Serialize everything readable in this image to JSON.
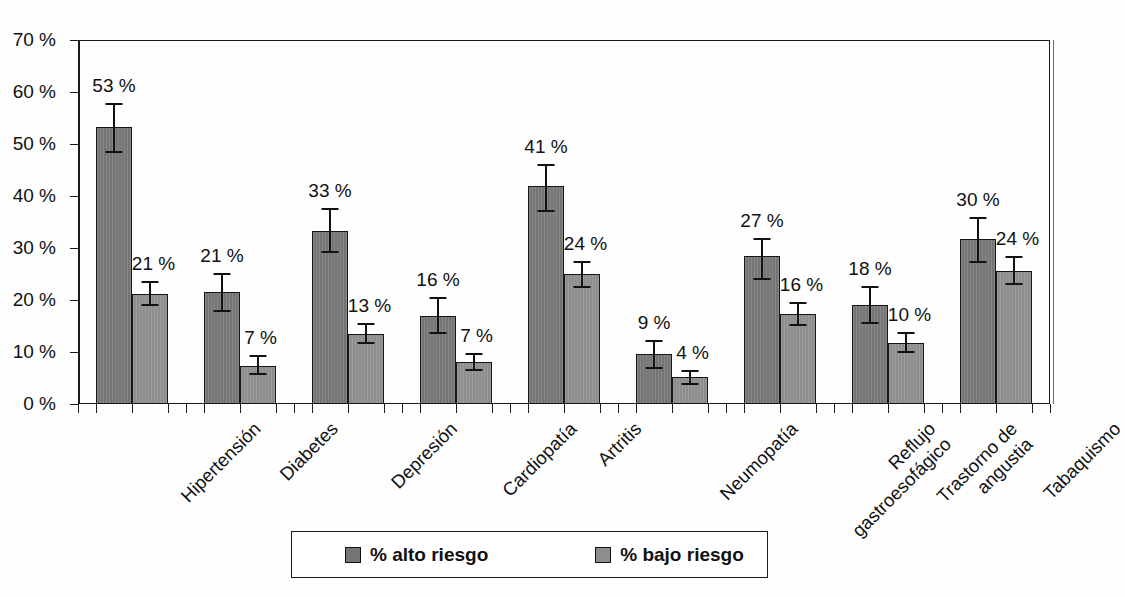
{
  "chart_data": {
    "type": "bar",
    "title": "",
    "subtitle": "",
    "xlabel": "",
    "ylabel": "",
    "ylim": [
      0,
      70
    ],
    "ytick_values": [
      0,
      10,
      20,
      30,
      40,
      50,
      60,
      70
    ],
    "ytick_labels": [
      "0 %",
      "10 %",
      "20 %",
      "30 %",
      "40 %",
      "50 %",
      "60 %",
      "70 %"
    ],
    "grid": false,
    "legend_position": "bottom",
    "categories": [
      "Hipertensión",
      "Diabetes",
      "Depresión",
      "Cardiopatía",
      "Artritis",
      "Neumopatía",
      "Reflujo gastroesofágico",
      "Trastorno de angustia",
      "Tabaquismo"
    ],
    "category_lines": [
      [
        "Hipertensión"
      ],
      [
        "Diabetes"
      ],
      [
        "Depresión"
      ],
      [
        "Cardiopatía"
      ],
      [
        "Artritis"
      ],
      [
        "Neumopatía"
      ],
      [
        "Reflujo",
        "gastroesofágico"
      ],
      [
        "Trastorno de",
        "angustia"
      ],
      [
        "Tabaquismo"
      ]
    ],
    "series": [
      {
        "name": "% alto riesgo",
        "color": "#757575",
        "values": [
          53,
          21,
          33,
          16,
          41,
          9,
          27,
          18,
          30
        ],
        "labels": [
          "53 %",
          "21 %",
          "33 %",
          "16 %",
          "41 %",
          "9 %",
          "27 %",
          "18 %",
          "30 %"
        ],
        "bar_tops": [
          53.2,
          21.5,
          33.3,
          17.0,
          42.0,
          9.7,
          28.4,
          19.0,
          31.8
        ],
        "err_low": [
          48.2,
          17.6,
          29.0,
          13.5,
          37.0,
          6.8,
          23.8,
          15.3,
          27.2
        ],
        "err_high": [
          57.8,
          25.2,
          37.6,
          20.5,
          46.2,
          12.4,
          32.0,
          22.6,
          36.0
        ]
      },
      {
        "name": "% bajo riesgo",
        "color": "#8d8d8d",
        "values": [
          21,
          7,
          13,
          7,
          24,
          4,
          16,
          10,
          24
        ],
        "labels": [
          "21 %",
          "7 %",
          "13 %",
          "7 %",
          "24 %",
          "4 %",
          "16 %",
          "10 %",
          "24 %"
        ],
        "bar_tops": [
          21.2,
          7.4,
          13.5,
          8.0,
          25.0,
          5.1,
          17.4,
          11.8,
          25.6
        ],
        "err_low": [
          18.8,
          5.6,
          11.6,
          6.3,
          22.3,
          3.6,
          15.0,
          9.9,
          22.9
        ],
        "err_high": [
          23.6,
          9.4,
          15.5,
          9.9,
          27.5,
          6.6,
          19.6,
          13.8,
          28.4
        ]
      }
    ],
    "legend": [
      {
        "label": "% alto riesgo",
        "color": "#757575"
      },
      {
        "label": "% bajo riesgo",
        "color": "#8d8d8d"
      }
    ]
  }
}
